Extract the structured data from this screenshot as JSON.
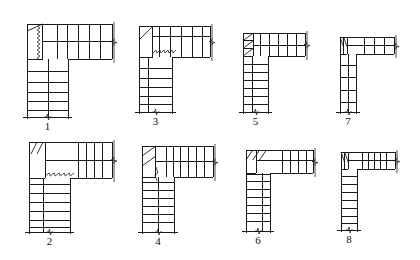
{
  "figures": [
    {
      "label": "1",
      "left": 27,
      "top": 24,
      "right": 112,
      "barBottom": 59,
      "legRight": 68,
      "legBottom": 117,
      "legDivider": 38,
      "landingCols": 1,
      "landingRows": 1,
      "barTreads": [
        57,
        67,
        78,
        89,
        100
      ],
      "barMidY": 41,
      "legTreads": [
        71,
        82,
        92,
        101,
        110
      ],
      "legMidX": 48,
      "winderMark": "zigzag-vertical",
      "winderX": 38
    },
    {
      "label": "3",
      "left": 139,
      "top": 26,
      "right": 210,
      "barBottom": 57,
      "legRight": 172,
      "legBottom": 112,
      "legDivider": 148,
      "barTreads": [
        159,
        170,
        181,
        192,
        202
      ],
      "barMidY": 36,
      "legTreads": [
        68,
        78,
        87,
        96,
        104
      ],
      "legMidX": 148,
      "winderMark": "zigzag-horizontal",
      "winderY": 51
    },
    {
      "label": "5",
      "left": 243,
      "top": 33,
      "right": 305,
      "barBottom": 56,
      "legRight": 268,
      "legBottom": 112,
      "legDivider": 252,
      "barTreads": [
        260,
        269,
        278,
        287,
        296
      ],
      "barMidY": 45,
      "legTreads": [
        64,
        72,
        80,
        88,
        96,
        104
      ],
      "legMidX": 252,
      "winderMark": "diagonal-triple"
    },
    {
      "label": "7",
      "left": 340,
      "top": 37,
      "right": 394,
      "barBottom": 54,
      "legRight": 356,
      "legBottom": 112,
      "legDivider": 348,
      "barTreads": [
        364,
        374,
        384
      ],
      "barMidY": 45,
      "legTreads": [
        65,
        77,
        90,
        102
      ],
      "legMidX": 348,
      "winderMark": "diagonal-double"
    },
    {
      "label": "2",
      "left": 29,
      "top": 142,
      "right": 112,
      "barBottom": 178,
      "legRight": 70,
      "legBottom": 232,
      "legDivider": 43,
      "barTreads": [
        78,
        86,
        94,
        102
      ],
      "barMidY": 160,
      "legTreads": [
        166,
        175,
        184,
        193,
        202,
        211,
        220,
        227
      ],
      "legMidX": 43,
      "winderMark": "zigzag-horizontal-2"
    },
    {
      "label": "4",
      "left": 142,
      "top": 146,
      "right": 213,
      "barBottom": 177,
      "legRight": 174,
      "legBottom": 232,
      "legDivider": 158,
      "barTreads": [
        166,
        173,
        180,
        188,
        196,
        204
      ],
      "barMidY": 161,
      "legTreads": [
        172,
        182,
        190,
        198,
        206,
        214,
        222
      ],
      "legMidX": 158,
      "winderMark": "diagonal-plus-zig"
    },
    {
      "label": "6",
      "left": 246,
      "top": 150,
      "right": 313,
      "barBottom": 173,
      "legRight": 270,
      "legBottom": 231,
      "legDivider": 262,
      "barTreads": [
        282,
        290,
        298,
        306
      ],
      "barMidY": 160,
      "legTreads": [
        174,
        181,
        189,
        197,
        205,
        213,
        221
      ],
      "legMidX": 262,
      "winderMark": "diagonal-triple-top"
    },
    {
      "label": "8",
      "left": 341,
      "top": 152,
      "right": 395,
      "barBottom": 169,
      "legRight": 357,
      "legBottom": 230,
      "legDivider": 357,
      "barTreads": [
        362,
        368,
        374,
        380,
        386
      ],
      "barMidY": 160,
      "legTreads": [
        176,
        184,
        192,
        200,
        208,
        216,
        223
      ],
      "legMidX": 357,
      "winderMark": "diagonal-double-small"
    }
  ],
  "labels": {
    "f1": "1",
    "f2": "2",
    "f3": "3",
    "f4": "4",
    "f5": "5",
    "f6": "6",
    "f7": "7",
    "f8": "8"
  }
}
